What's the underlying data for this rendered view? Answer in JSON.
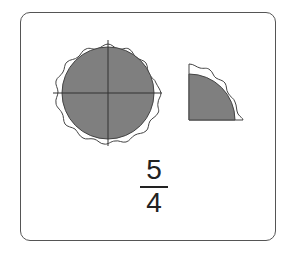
{
  "figure": {
    "whole_pies": 1,
    "pieces_per_pie": 4,
    "extra_pieces": 1,
    "fill_color": "#7f7f7f",
    "crust_color": "#ffffff",
    "stroke_color": "#444444"
  },
  "fraction": {
    "numerator": "5",
    "denominator": "4"
  }
}
